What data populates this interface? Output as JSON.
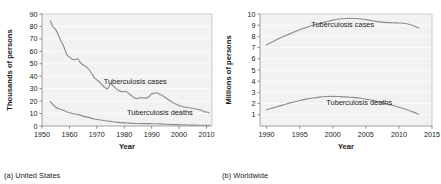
{
  "figure": {
    "panels": [
      {
        "id": "a",
        "caption": "(a) United States",
        "chart_data": {
          "type": "line",
          "title": "",
          "xlabel": "Year",
          "ylabel": "Thousands of persons",
          "xlim": [
            1950,
            2012
          ],
          "ylim": [
            0,
            90
          ],
          "xticks": [
            1950,
            1960,
            1970,
            1980,
            1990,
            2000,
            2010
          ],
          "yticks": [
            0,
            10,
            20,
            30,
            40,
            50,
            60,
            70,
            80,
            90
          ],
          "grid": "horizontal",
          "legend": "inline-annotations",
          "annotations": [
            {
              "text": "Tuberculosis cases",
              "x": 1984,
              "y": 34
            },
            {
              "text": "Tuberculosis deaths",
              "x": 1993,
              "y": 9
            }
          ],
          "series": [
            {
              "name": "Tuberculosis cases",
              "x": [
                1953,
                1954,
                1955,
                1956,
                1957,
                1958,
                1959,
                1960,
                1961,
                1962,
                1963,
                1964,
                1965,
                1966,
                1967,
                1968,
                1969,
                1970,
                1971,
                1972,
                1973,
                1974,
                1975,
                1976,
                1977,
                1978,
                1979,
                1980,
                1981,
                1982,
                1983,
                1984,
                1985,
                1986,
                1987,
                1988,
                1989,
                1990,
                1991,
                1992,
                1993,
                1994,
                1995,
                1996,
                1997,
                1998,
                1999,
                2000,
                2001,
                2002,
                2003,
                2004,
                2005,
                2006,
                2007,
                2008,
                2009,
                2010,
                2011
              ],
              "y": [
                84.3,
                79.8,
                77.4,
                73.0,
                67.9,
                63.5,
                57.5,
                55.5,
                53.7,
                53.3,
                54.0,
                50.9,
                49.0,
                47.8,
                45.6,
                42.6,
                39.1,
                37.1,
                35.2,
                32.9,
                30.9,
                30.1,
                33.9,
                32.1,
                30.1,
                28.5,
                27.7,
                27.7,
                27.4,
                25.5,
                23.8,
                22.3,
                22.2,
                22.8,
                22.5,
                22.4,
                23.5,
                25.7,
                26.3,
                26.7,
                25.3,
                24.4,
                22.9,
                21.3,
                19.9,
                18.4,
                17.5,
                16.4,
                15.9,
                15.1,
                14.9,
                14.5,
                14.1,
                13.7,
                13.3,
                12.9,
                11.5,
                11.2,
                10.5
              ]
            },
            {
              "name": "Tuberculosis deaths",
              "x": [
                1953,
                1955,
                1957,
                1959,
                1961,
                1963,
                1965,
                1967,
                1969,
                1971,
                1973,
                1975,
                1977,
                1979,
                1981,
                1983,
                1985,
                1987,
                1989,
                1991,
                1993,
                1995,
                1997,
                1999,
                2001,
                2003,
                2005,
                2007,
                2009,
                2011
              ],
              "y": [
                19.7,
                15.0,
                13.2,
                11.5,
                10.0,
                9.3,
                7.9,
                6.9,
                5.6,
                5.0,
                4.2,
                3.7,
                3.1,
                2.7,
                2.4,
                2.1,
                2.0,
                1.9,
                1.9,
                1.8,
                1.7,
                1.4,
                1.2,
                1.1,
                1.0,
                0.8,
                0.7,
                0.6,
                0.6,
                0.5
              ]
            }
          ]
        }
      },
      {
        "id": "b",
        "caption": "(b) Worldwide",
        "chart_data": {
          "type": "line",
          "title": "",
          "xlabel": "Year",
          "ylabel": "Millions of persons",
          "xlim": [
            1989,
            2015
          ],
          "ylim": [
            0,
            10
          ],
          "xticks": [
            1990,
            1995,
            2000,
            2005,
            2010,
            2015
          ],
          "yticks": [
            1,
            2,
            3,
            4,
            5,
            6,
            7,
            8,
            9,
            10
          ],
          "grid": "horizontal",
          "legend": "inline-annotations",
          "annotations": [
            {
              "text": "Tuberculosis cases",
              "x": 2001.5,
              "y": 8.85
            },
            {
              "text": "Tuberculosis deaths",
              "x": 2004.0,
              "y": 1.85
            }
          ],
          "series": [
            {
              "name": "Tuberculosis cases",
              "x": [
                1990,
                1991,
                1992,
                1993,
                1994,
                1995,
                1996,
                1997,
                1998,
                1999,
                2000,
                2001,
                2002,
                2003,
                2004,
                2005,
                2006,
                2007,
                2008,
                2009,
                2010,
                2011,
                2012,
                2013
              ],
              "y": [
                7.25,
                7.55,
                7.85,
                8.1,
                8.35,
                8.6,
                8.8,
                9.0,
                9.15,
                9.3,
                9.45,
                9.55,
                9.6,
                9.6,
                9.58,
                9.5,
                9.4,
                9.3,
                9.25,
                9.22,
                9.2,
                9.15,
                9.0,
                8.75
              ]
            },
            {
              "name": "Tuberculosis deaths",
              "x": [
                1990,
                1991,
                1992,
                1993,
                1994,
                1995,
                1996,
                1997,
                1998,
                1999,
                2000,
                2001,
                2002,
                2003,
                2004,
                2005,
                2006,
                2007,
                2008,
                2009,
                2010,
                2011,
                2012,
                2013
              ],
              "y": [
                1.45,
                1.62,
                1.8,
                1.97,
                2.12,
                2.28,
                2.4,
                2.5,
                2.58,
                2.63,
                2.65,
                2.63,
                2.6,
                2.55,
                2.5,
                2.4,
                2.3,
                2.15,
                2.0,
                1.85,
                1.68,
                1.5,
                1.28,
                1.05
              ]
            }
          ]
        }
      }
    ]
  }
}
